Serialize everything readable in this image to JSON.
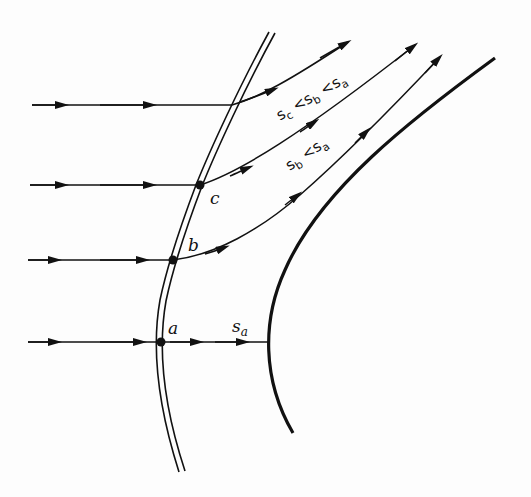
{
  "diagram": {
    "type": "streamlines-through-curved-shock",
    "colors": {
      "ink": "#111111",
      "background": "#fdfdfd"
    },
    "points": [
      {
        "id": "a",
        "label": "a"
      },
      {
        "id": "b",
        "label": "b"
      },
      {
        "id": "c",
        "label": "c"
      }
    ],
    "labels": {
      "s_a": "s",
      "s_a_sub": "a",
      "relation_upper": {
        "c": "s",
        "c_sub": "c",
        "lt1": "<",
        "b": "s",
        "b_sub": "b",
        "lt2": "<",
        "a": "s",
        "a_sub": "a"
      },
      "relation_lower": {
        "b": "s",
        "b_sub": "b",
        "lt": "<",
        "a": "s",
        "a_sub": "a"
      }
    },
    "elements": [
      "curved shock (double line)",
      "blunt body surface",
      "4 streamlines with arrows"
    ]
  }
}
